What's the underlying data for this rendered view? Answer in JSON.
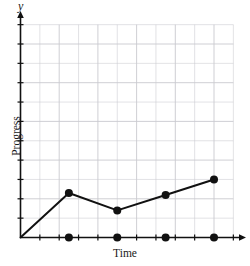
{
  "chart_data": {
    "type": "line",
    "title": "",
    "subtitle": "",
    "xlabel": "Time",
    "ylabel": "Progress",
    "y_axis_letter": "y",
    "grid": true,
    "legend": null,
    "xlim": [
      0,
      11
    ],
    "ylim": [
      0,
      11
    ],
    "x_tick_count": 11,
    "y_tick_count": 11,
    "x_tick_labels": [],
    "y_tick_labels": [],
    "series": [
      {
        "name": "Progress over time",
        "marker": "filled-circle",
        "x": [
          0,
          2.5,
          5,
          7.5,
          10
        ],
        "y": [
          0,
          2.3,
          1.4,
          2.2,
          3.0
        ],
        "points": [
          {
            "x": 0,
            "y": 0,
            "marker": false
          },
          {
            "x": 2.5,
            "y": 2.3,
            "marker": true
          },
          {
            "x": 5,
            "y": 1.4,
            "marker": true
          },
          {
            "x": 7.5,
            "y": 2.2,
            "marker": true
          },
          {
            "x": 10,
            "y": 3.0,
            "marker": true
          }
        ]
      },
      {
        "name": "Time axis markers",
        "marker": "filled-circle",
        "x": [
          2.5,
          5,
          7.5,
          10
        ],
        "y": [
          0,
          0,
          0,
          0
        ]
      }
    ],
    "colors": {
      "line": "#111111",
      "marker": "#111111",
      "axis": "#111111",
      "grid": "#c9c9cf",
      "background": "#ffffff"
    }
  }
}
